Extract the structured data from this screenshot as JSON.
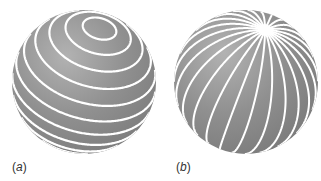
{
  "figure": {
    "panels": [
      {
        "id": "a",
        "label": "(a)",
        "label_letter": "a",
        "description": "Sphere with circles of latitude (parallel rings) around a tilted pole",
        "center": [
          84,
          82
        ],
        "radius": 72,
        "pole": [
          100,
          27
        ],
        "line_count": 12,
        "pattern": "latitude"
      },
      {
        "id": "b",
        "label": "(b)",
        "label_letter": "b",
        "description": "Sphere with meridian lines (longitudes) converging at a tilted pole",
        "center": [
          246,
          82
        ],
        "radius": 72,
        "pole": [
          265,
          30
        ],
        "line_count": 24,
        "pattern": "longitude"
      }
    ],
    "colors": {
      "sphere_fill": "#8c8c8c",
      "sphere_highlight": "#b5b5b5",
      "sphere_shadow": "#7a7a7a",
      "line": "#ffffff",
      "label": "#333333"
    }
  }
}
